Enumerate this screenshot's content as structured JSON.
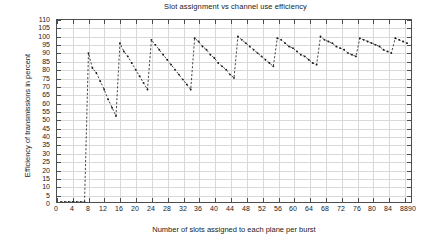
{
  "chart": {
    "title": "Slot assignment vs channel use efficiency",
    "xlabel": "Number of slots assigned to each plane per burst",
    "ylabel": "Efficiency of transmissions in percent"
  },
  "chart_data": {
    "type": "line",
    "title": "Slot assignment vs channel use efficiency",
    "xlabel": "Number of slots assigned to each plane per burst",
    "ylabel": "Efficiency of transmissions in percent",
    "xlim": [
      0,
      90
    ],
    "ylim": [
      0,
      110
    ],
    "xticks": [
      0,
      4,
      8,
      12,
      16,
      20,
      24,
      28,
      32,
      36,
      40,
      44,
      48,
      52,
      56,
      60,
      64,
      68,
      72,
      76,
      80,
      84,
      88,
      90
    ],
    "xtick_labels": [
      "0",
      "4",
      "8",
      "12",
      "16",
      "20",
      "24",
      "28",
      "32",
      "36",
      "40",
      "44",
      "48",
      "52",
      "56",
      "60",
      "64",
      "68",
      "72",
      "76",
      "80",
      "84",
      "88",
      "90"
    ],
    "yticks": [
      0,
      5,
      10,
      15,
      20,
      25,
      30,
      35,
      40,
      45,
      50,
      55,
      60,
      65,
      70,
      75,
      80,
      85,
      90,
      95,
      100,
      105,
      110
    ],
    "ytick_labels": [
      "0",
      "5",
      "10",
      "15",
      "20",
      "25",
      "30",
      "35",
      "40",
      "45",
      "50",
      "55",
      "60",
      "65",
      "70",
      "75",
      "80",
      "85",
      "90",
      "95",
      "100",
      "105",
      "110"
    ],
    "grid": true,
    "legend": false,
    "marker": "dot",
    "linestyle": "dashed",
    "color": "#1a1a1a",
    "series": [
      {
        "name": "efficiency",
        "x": [
          1,
          2,
          3,
          4,
          5,
          6,
          7,
          8,
          9,
          10,
          11,
          12,
          13,
          14,
          15,
          16,
          17,
          18,
          19,
          20,
          21,
          22,
          23,
          24,
          25,
          26,
          27,
          28,
          29,
          30,
          31,
          32,
          33,
          34,
          35,
          36,
          37,
          38,
          39,
          40,
          41,
          42,
          43,
          44,
          45,
          46,
          47,
          48,
          49,
          50,
          51,
          52,
          53,
          54,
          55,
          56,
          57,
          58,
          59,
          60,
          61,
          62,
          63,
          64,
          65,
          66,
          67,
          68,
          69,
          70,
          71,
          72,
          73,
          74,
          75,
          76,
          77,
          78,
          79,
          80,
          81,
          82,
          83,
          84,
          85,
          86,
          87,
          88,
          89
        ],
        "y": [
          0,
          0,
          0,
          0,
          0,
          0,
          0,
          90,
          81,
          78,
          73,
          68,
          62,
          57,
          52,
          96,
          91,
          88,
          84,
          80,
          76,
          72,
          68,
          98,
          95,
          92,
          89,
          86,
          83,
          80,
          77,
          74,
          71,
          68,
          99,
          97,
          94,
          92,
          89,
          87,
          84,
          82,
          80,
          77,
          75,
          100,
          98,
          96,
          94,
          92,
          90,
          88,
          86,
          84,
          82,
          99,
          98,
          96,
          94,
          93,
          91,
          89,
          88,
          86,
          84,
          83,
          100,
          98,
          97,
          96,
          94,
          93,
          92,
          90,
          89,
          88,
          99,
          98,
          97,
          96,
          95,
          94,
          92,
          91,
          90,
          99,
          98,
          97,
          96
        ]
      }
    ]
  }
}
